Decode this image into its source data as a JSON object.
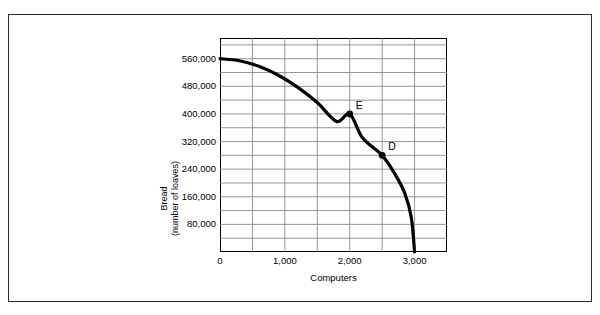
{
  "figure": {
    "caption": "FIGURE 2-2"
  },
  "chart_data": {
    "type": "line",
    "title": "",
    "xlabel": "Computers",
    "ylabel_line1": "Bread",
    "ylabel_line2": "(number of loaves)",
    "xlim": [
      0,
      3500
    ],
    "ylim": [
      0,
      620000
    ],
    "grid": true,
    "legend": "none",
    "x_ticks": [
      0,
      1000,
      2000,
      3000
    ],
    "x_tick_labels": [
      "0",
      "1,000",
      "2,000",
      "3,000"
    ],
    "x_gridline_step": 500,
    "y_ticks": [
      80000,
      160000,
      240000,
      320000,
      400000,
      480000,
      560000
    ],
    "y_tick_labels": [
      "80,000",
      "160,000",
      "240,000",
      "320,000",
      "400,000",
      "480,000",
      "560,000"
    ],
    "y_gridline_step": 40000,
    "curve_name": "production possibilities frontier",
    "curve_color": "#000000",
    "curve_width": 3.2,
    "x": [
      0,
      250,
      500,
      750,
      1000,
      1250,
      1500,
      1750,
      2000,
      2250,
      2500,
      2700,
      2850,
      2950,
      3000
    ],
    "y": [
      560000,
      556000,
      545000,
      527000,
      502000,
      471000,
      433000,
      389000,
      400000,
      345000,
      280000,
      222000,
      165000,
      105000,
      0
    ],
    "curve_points": [
      [
        0,
        560000
      ],
      [
        300,
        554000
      ],
      [
        600,
        538000
      ],
      [
        900,
        512000
      ],
      [
        1200,
        477000
      ],
      [
        1500,
        433000
      ],
      [
        1800,
        378000
      ],
      [
        2000,
        400000
      ],
      [
        2200,
        330000
      ],
      [
        2500,
        280000
      ],
      [
        2700,
        225000
      ],
      [
        2850,
        170000
      ],
      [
        2950,
        100000
      ],
      [
        3000,
        0
      ]
    ],
    "annotations": [
      {
        "label": "E",
        "x": 2000,
        "y": 400000
      },
      {
        "label": "D",
        "x": 2500,
        "y": 280000
      }
    ]
  }
}
